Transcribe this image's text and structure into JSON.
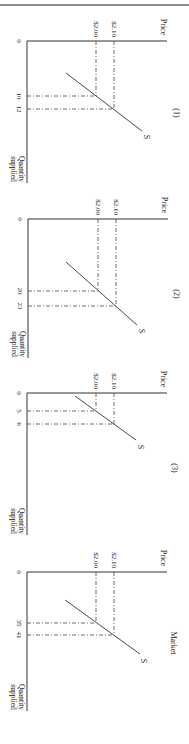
{
  "page": {
    "orientation": "rotated 90deg clockwise"
  },
  "chart_data": [
    {
      "type": "line",
      "title": "(1)",
      "xlabel": "Quantity supplied",
      "ylabel": "Price",
      "origin_label": "0",
      "series": [
        {
          "name": "S",
          "points": [
            {
              "quantity": 10,
              "price": 2.0
            },
            {
              "quantity": 12,
              "price": 2.1
            }
          ]
        }
      ],
      "price_ticks": [
        "$2.00",
        "$2.10"
      ],
      "quantity_ticks": [
        "10",
        "12"
      ],
      "grid": false,
      "layout": {
        "ox": 27,
        "oy": 41,
        "axisEndX": 167,
        "axisEndY": 183,
        "px": [
          96,
          114
        ],
        "qy": [
          96,
          109
        ],
        "s": [
          66,
          73,
          142,
          131
        ],
        "sLabel": [
          146,
          137
        ],
        "titlePos": [
          176,
          113
        ]
      }
    },
    {
      "type": "line",
      "title": "(2)",
      "xlabel": "Quantity supplied",
      "ylabel": "Price",
      "origin_label": "0",
      "series": [
        {
          "name": "S",
          "points": [
            {
              "quantity": 20,
              "price": 2.0
            },
            {
              "quantity": 23,
              "price": 2.1
            }
          ]
        }
      ],
      "price_ticks": [
        "$2.00",
        "$2.10"
      ],
      "quantity_ticks": [
        "20",
        "23"
      ],
      "grid": false,
      "layout": {
        "ox": 28,
        "oy": 219,
        "axisEndX": 168,
        "axisEndY": 358,
        "px": [
          98,
          116
        ],
        "qy": [
          291,
          306
        ],
        "s": [
          66,
          262,
          137,
          325
        ],
        "sLabel": [
          141,
          331
        ],
        "titlePos": [
          176,
          294
        ]
      }
    },
    {
      "type": "line",
      "title": "(3)",
      "xlabel": "Quantity supplied",
      "ylabel": "Price",
      "origin_label": "0",
      "series": [
        {
          "name": "S",
          "points": [
            {
              "quantity": 5,
              "price": 2.0
            },
            {
              "quantity": 6,
              "price": 2.1
            }
          ]
        }
      ],
      "price_ticks": [
        "$2.00",
        "$2.10"
      ],
      "quantity_ticks": [
        "5",
        "6"
      ],
      "grid": false,
      "layout": {
        "ox": 27,
        "oy": 393,
        "axisEndX": 167,
        "axisEndY": 535,
        "px": [
          96,
          114
        ],
        "qy": [
          411,
          424
        ],
        "s": [
          75,
          396,
          136,
          440
        ],
        "sLabel": [
          140,
          447
        ],
        "titlePos": [
          174,
          468
        ]
      }
    },
    {
      "type": "line",
      "title": "Market",
      "xlabel": "Quantity supplied",
      "ylabel": "Price",
      "origin_label": "0",
      "series": [
        {
          "name": "S",
          "points": [
            {
              "quantity": 35,
              "price": 2.0
            },
            {
              "quantity": 41,
              "price": 2.1
            }
          ]
        }
      ],
      "price_ticks": [
        "$2.00",
        "$2.10"
      ],
      "quantity_ticks": [
        "35",
        "41"
      ],
      "grid": false,
      "layout": {
        "ox": 27,
        "oy": 572,
        "axisEndX": 167,
        "axisEndY": 711,
        "px": [
          96,
          114
        ],
        "qy": [
          623,
          635
        ],
        "s": [
          65,
          600,
          140,
          654
        ],
        "sLabel": [
          143,
          661
        ],
        "titlePos": [
          173,
          643
        ]
      }
    }
  ]
}
